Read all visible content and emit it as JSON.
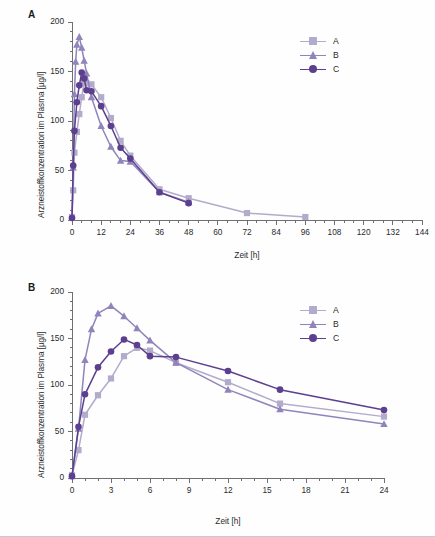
{
  "figure": {
    "background": "#fefefe",
    "panels": [
      "A",
      "B"
    ]
  },
  "colors": {
    "series_a": "#b3abcb",
    "series_b": "#9084bb",
    "series_c": "#5c3f8e",
    "axis": "#6f6f76",
    "text": "#2b2b2b"
  },
  "panel_a": {
    "label": "A",
    "legend": [
      "A",
      "B",
      "C"
    ]
  },
  "panel_b": {
    "label": "B",
    "legend": [
      "A",
      "B",
      "C"
    ]
  },
  "chart_data": [
    {
      "type": "line",
      "panel": "A",
      "title": "",
      "xlabel": "Zeit [h]",
      "ylabel": "Arzneistoffkonzentration im Plasma [µg/l]",
      "xlim": [
        0,
        144
      ],
      "ylim": [
        0,
        200
      ],
      "xticks": [
        0,
        12,
        24,
        36,
        48,
        60,
        72,
        84,
        96,
        108,
        120,
        132,
        144
      ],
      "yticks": [
        0,
        50,
        100,
        150,
        200
      ],
      "xtick_labels": [
        "0",
        "12",
        "24",
        "36",
        "48",
        "60",
        "72",
        "84",
        "96",
        "108",
        "120",
        "132",
        "144"
      ],
      "ytick_labels": [
        "0",
        "50",
        "100",
        "150",
        "200"
      ],
      "x_minor_step": 4,
      "y_minor_step": 10,
      "grid": false,
      "legend_position": "top-right",
      "series": [
        {
          "name": "A",
          "marker": "square",
          "color": "#b3abcb",
          "x": [
            0,
            0.5,
            1,
            2,
            3,
            4,
            5,
            6,
            8,
            12,
            16,
            20,
            24,
            36,
            48,
            72,
            96
          ],
          "y": [
            3,
            30,
            68,
            89,
            107,
            124,
            140,
            138,
            137,
            124,
            103,
            80,
            65,
            31,
            22,
            7,
            3
          ]
        },
        {
          "name": "B",
          "marker": "triangle",
          "color": "#9084bb",
          "x": [
            0,
            0.5,
            1,
            1.5,
            2,
            3,
            4,
            5,
            6,
            8,
            12,
            16,
            20,
            24,
            36,
            48
          ],
          "y": [
            2,
            53,
            127,
            160,
            177,
            185,
            174,
            161,
            148,
            124,
            95,
            74,
            60,
            59,
            28,
            18
          ]
        },
        {
          "name": "C",
          "marker": "circle",
          "color": "#5c3f8e",
          "x": [
            0,
            0.5,
            1,
            2,
            3,
            4,
            5,
            6,
            8,
            12,
            16,
            20,
            24,
            36,
            48
          ],
          "y": [
            2,
            55,
            90,
            119,
            136,
            149,
            143,
            131,
            130,
            115,
            95,
            73,
            62,
            28,
            17
          ]
        }
      ]
    },
    {
      "type": "line",
      "panel": "B",
      "title": "",
      "xlabel": "Zeit [h]",
      "ylabel": "Arzneistoffkonzentration im Plasma [µg/l]",
      "xlim": [
        0,
        24
      ],
      "ylim": [
        0,
        200
      ],
      "xticks": [
        0,
        3,
        6,
        9,
        12,
        15,
        18,
        21,
        24
      ],
      "yticks": [
        0,
        50,
        100,
        150,
        200
      ],
      "xtick_labels": [
        "0",
        "3",
        "6",
        "9",
        "12",
        "15",
        "18",
        "21",
        "24"
      ],
      "ytick_labels": [
        "0",
        "50",
        "100",
        "150",
        "200"
      ],
      "x_minor_step": 1,
      "y_minor_step": 10,
      "grid": false,
      "legend_position": "top-right",
      "series": [
        {
          "name": "A",
          "marker": "square",
          "color": "#b3abcb",
          "x": [
            0,
            0.5,
            1,
            2,
            3,
            4,
            5,
            6,
            8,
            12,
            16,
            24
          ],
          "y": [
            3,
            30,
            68,
            89,
            107,
            131,
            140,
            137,
            124,
            103,
            80,
            66
          ]
        },
        {
          "name": "B",
          "marker": "triangle",
          "color": "#9084bb",
          "x": [
            0,
            0.5,
            1,
            1.5,
            2,
            3,
            4,
            5,
            6,
            8,
            12,
            16,
            24
          ],
          "y": [
            2,
            53,
            127,
            160,
            177,
            185,
            174,
            161,
            148,
            124,
            95,
            74,
            58
          ]
        },
        {
          "name": "C",
          "marker": "circle",
          "color": "#5c3f8e",
          "x": [
            0,
            0.5,
            1,
            2,
            3,
            4,
            5,
            6,
            8,
            12,
            16,
            24
          ],
          "y": [
            2,
            55,
            90,
            119,
            136,
            149,
            143,
            131,
            130,
            115,
            95,
            73,
            62
          ]
        }
      ]
    }
  ]
}
